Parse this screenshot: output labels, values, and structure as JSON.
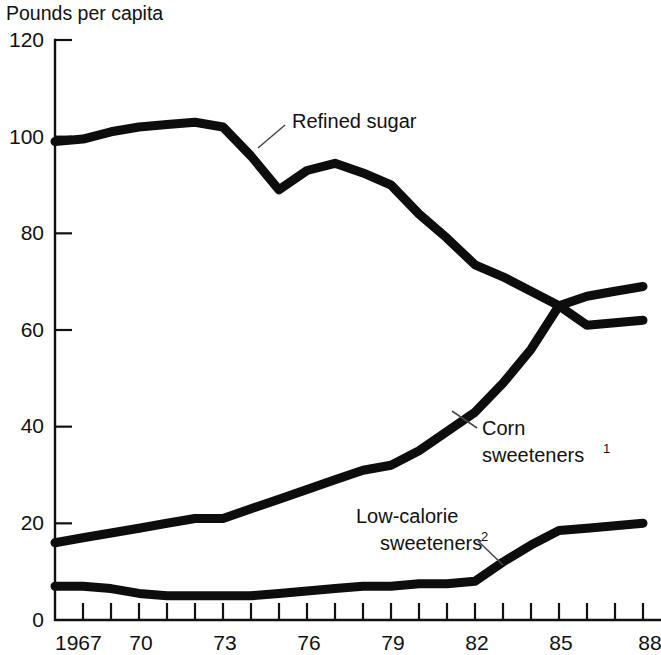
{
  "chart_data": {
    "type": "line",
    "title": "Pounds per capita",
    "xlabel": "",
    "ylabel": "Pounds per capita",
    "xlim": [
      1967,
      1988
    ],
    "ylim": [
      0,
      120
    ],
    "grid": false,
    "legend_position": "inline-labels",
    "y_ticks": [
      0,
      20,
      40,
      60,
      80,
      100,
      120
    ],
    "y_tick_labels": [
      "0",
      "20",
      "40",
      "60",
      "80",
      "100",
      "120"
    ],
    "x_ticks": [
      1967,
      1968,
      1969,
      1970,
      1971,
      1972,
      1973,
      1974,
      1975,
      1976,
      1977,
      1978,
      1979,
      1980,
      1981,
      1982,
      1983,
      1984,
      1985,
      1986,
      1987,
      1988
    ],
    "x_tick_labels": [
      "1967",
      "",
      "",
      "70",
      "",
      "",
      "73",
      "",
      "",
      "76",
      "",
      "",
      "79",
      "",
      "",
      "82",
      "",
      "",
      "85",
      "",
      "",
      "88"
    ],
    "x": [
      1967,
      1968,
      1969,
      1970,
      1971,
      1972,
      1973,
      1974,
      1975,
      1976,
      1977,
      1978,
      1979,
      1980,
      1981,
      1982,
      1983,
      1984,
      1985,
      1986,
      1987,
      1988
    ],
    "series": [
      {
        "name": "Refined sugar",
        "label": "Refined sugar",
        "color": "#0d0d0d",
        "values": [
          99,
          99.5,
          101,
          102,
          102.5,
          103,
          102,
          96,
          89,
          93,
          94.5,
          92.5,
          90,
          84,
          79,
          73.5,
          71,
          68,
          65,
          61,
          61.5,
          62
        ]
      },
      {
        "name": "Corn sweeteners",
        "label": "Corn",
        "label_line2": "sweeteners",
        "label_sup": "1",
        "color": "#0d0d0d",
        "values": [
          16,
          17,
          18,
          19,
          20,
          21,
          21,
          23,
          25,
          27,
          29,
          31,
          32,
          35,
          39,
          43,
          49,
          56,
          65,
          67,
          68,
          69
        ]
      },
      {
        "name": "Low-calorie sweeteners",
        "label": "Low-calorie",
        "label_line2": "sweeteners",
        "label_sup": "2",
        "color": "#0d0d0d",
        "values": [
          7,
          7,
          6.5,
          5.5,
          5,
          5,
          5,
          5,
          5.5,
          6,
          6.5,
          7,
          7,
          7.5,
          7.5,
          8,
          12,
          15.5,
          18.5,
          19,
          19.5,
          20
        ]
      }
    ],
    "annotations": [
      {
        "text": "Refined sugar",
        "series": "Refined sugar",
        "has_leader_line": true
      },
      {
        "text": "Corn sweeteners1",
        "series": "Corn sweeteners",
        "has_leader_line": true
      },
      {
        "text": "Low-calorie sweeteners2",
        "series": "Low-calorie sweeteners",
        "has_leader_line": true
      }
    ]
  },
  "labels": {
    "axis_title": "Pounds per capita",
    "refined_sugar": "Refined sugar",
    "corn_line1": "Corn",
    "corn_line2": "sweeteners",
    "corn_sup": "1",
    "lowcal_line1": "Low-calorie",
    "lowcal_line2": "sweeteners",
    "lowcal_sup": "2",
    "y0": "0",
    "y20": "20",
    "y40": "40",
    "y60": "60",
    "y80": "80",
    "y100": "100",
    "y120": "120",
    "x1967": "1967",
    "x70": "70",
    "x73": "73",
    "x76": "76",
    "x79": "79",
    "x82": "82",
    "x85": "85",
    "x88": "88"
  }
}
